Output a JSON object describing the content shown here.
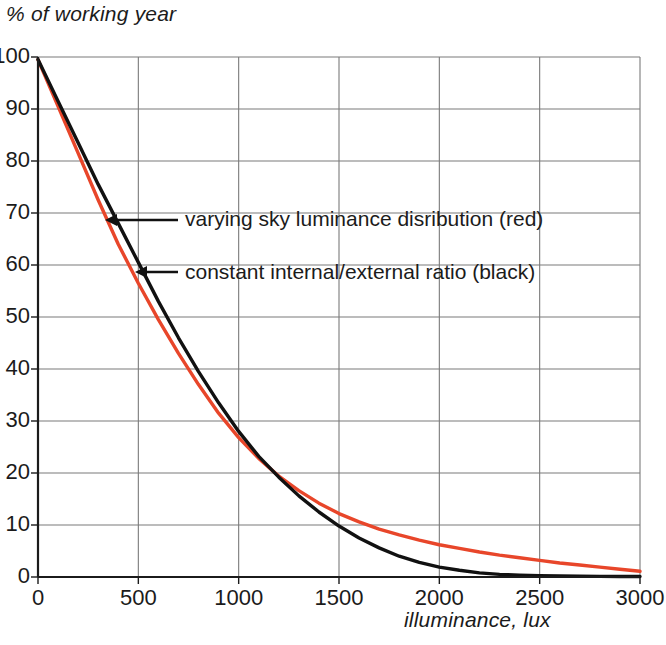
{
  "chart_data": {
    "type": "line",
    "title": "",
    "xlabel": "illuminance, lux",
    "ylabel": "% of working year",
    "xlim": [
      0,
      3000
    ],
    "ylim": [
      0,
      100
    ],
    "xticks": [
      0,
      500,
      1000,
      1500,
      2000,
      2500,
      3000
    ],
    "yticks": [
      0,
      10,
      20,
      30,
      40,
      50,
      60,
      70,
      80,
      90,
      100
    ],
    "grid": true,
    "legend_position": "inline-annotations",
    "series": [
      {
        "name": "varying sky luminance disribution (red)",
        "color": "#E8462A",
        "x": [
          0,
          100,
          200,
          300,
          400,
          500,
          600,
          700,
          800,
          900,
          1000,
          1100,
          1200,
          1300,
          1400,
          1500,
          1600,
          1700,
          1800,
          1900,
          2000,
          2100,
          2200,
          2300,
          2400,
          2500,
          2600,
          2700,
          2800,
          2900,
          3000
        ],
        "values": [
          99.5,
          90.5,
          81.5,
          72.5,
          64.0,
          56.5,
          49.5,
          43.0,
          37.0,
          31.5,
          26.8,
          22.8,
          19.4,
          16.6,
          14.2,
          12.2,
          10.6,
          9.2,
          8.1,
          7.1,
          6.2,
          5.5,
          4.8,
          4.2,
          3.7,
          3.2,
          2.7,
          2.3,
          1.9,
          1.5,
          1.1
        ]
      },
      {
        "name": "constant internal/external ratio (black)",
        "color": "#111111",
        "x": [
          0,
          100,
          200,
          300,
          400,
          500,
          600,
          700,
          800,
          900,
          1000,
          1100,
          1200,
          1300,
          1400,
          1500,
          1600,
          1700,
          1800,
          1900,
          2000,
          2100,
          2200,
          2300,
          2400,
          2500,
          2600,
          2700,
          2800,
          2900,
          3000
        ],
        "values": [
          99.5,
          91.5,
          83.5,
          75.5,
          68.0,
          60.5,
          53.0,
          46.0,
          39.5,
          33.5,
          28.0,
          23.2,
          19.2,
          15.6,
          12.5,
          9.8,
          7.5,
          5.6,
          4.0,
          2.8,
          1.9,
          1.3,
          0.8,
          0.5,
          0.35,
          0.25,
          0.2,
          0.15,
          0.12,
          0.1,
          0.1
        ]
      }
    ],
    "annotations": [
      {
        "text": "varying sky luminance disribution (red)",
        "target_x": 350,
        "target_y": 68
      },
      {
        "text": "constant internal/external ratio (black)",
        "target_x": 490,
        "target_y": 59
      }
    ]
  },
  "labels": {
    "y_axis_title": "% of working year",
    "x_axis_title": "illuminance, lux"
  },
  "colors": {
    "red_series": "#E8462A",
    "black_series": "#111111",
    "grid": "#7a7a7a",
    "axis": "#1b1b1b",
    "background": "#ffffff"
  }
}
